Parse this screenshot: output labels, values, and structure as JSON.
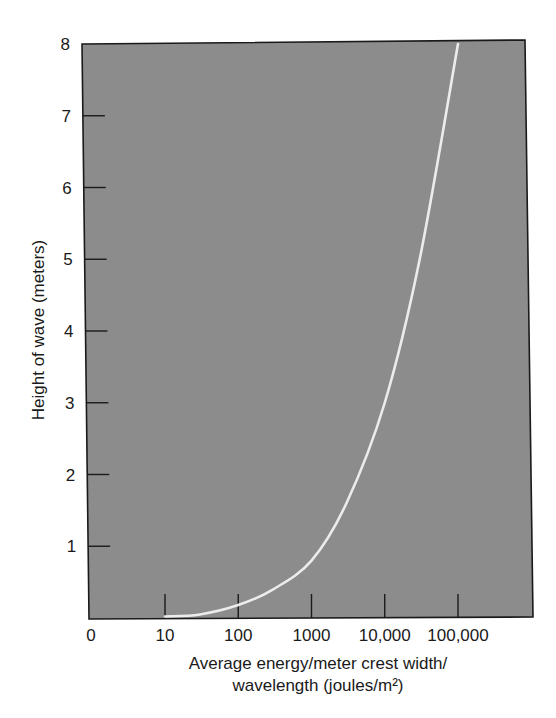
{
  "chart_data": {
    "type": "line",
    "title": "",
    "xlabel": "Average energy/meter crest width/ wavelength (joules/m²)",
    "xlabel_lines": [
      "Average energy/meter crest width/",
      "wavelength (joules/m²)"
    ],
    "ylabel": "Height of wave (meters)",
    "x_scale": "log",
    "x_tick_labels": [
      "0",
      "10",
      "100",
      "1000",
      "10,000",
      "100,000"
    ],
    "x_tick_values": [
      0,
      10,
      100,
      1000,
      10000,
      100000
    ],
    "y_tick_labels": [
      "1",
      "2",
      "3",
      "4",
      "5",
      "6",
      "7",
      "8"
    ],
    "y_tick_values": [
      1,
      2,
      3,
      4,
      5,
      6,
      7,
      8
    ],
    "ylim": [
      0,
      8
    ],
    "grid": false,
    "legend": null,
    "colors": {
      "plot_background": "#8c8c8c",
      "curve": "#ececec",
      "frame": "#1a1a1a"
    },
    "series": [
      {
        "name": "Wave height vs. energy",
        "x": [
          10,
          30,
          100,
          300,
          1000,
          3000,
          10000,
          30000,
          100000
        ],
        "y": [
          0.0,
          0.05,
          0.18,
          0.4,
          0.8,
          1.6,
          3.0,
          5.0,
          8.0
        ]
      }
    ]
  }
}
